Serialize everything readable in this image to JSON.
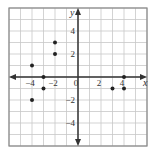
{
  "chart_data": {
    "type": "scatter",
    "title": "",
    "xlabel": "x",
    "ylabel": "y",
    "xlim": [
      -6,
      6
    ],
    "ylim": [
      -6,
      6
    ],
    "grid": true,
    "x_tick_labels": [
      {
        "value": -4,
        "text": "−4"
      },
      {
        "value": -2,
        "text": "−2"
      },
      {
        "value": 0,
        "text": "0"
      },
      {
        "value": 2,
        "text": "2"
      },
      {
        "value": 4,
        "text": "4"
      }
    ],
    "y_tick_labels": [
      {
        "value": 4,
        "text": "4"
      },
      {
        "value": 2,
        "text": "2"
      },
      {
        "value": -2,
        "text": "−2"
      },
      {
        "value": -4,
        "text": "−4"
      }
    ],
    "points": [
      {
        "x": -4,
        "y": 1
      },
      {
        "x": -4,
        "y": -2
      },
      {
        "x": -3,
        "y": 0
      },
      {
        "x": -3,
        "y": -1
      },
      {
        "x": -2,
        "y": 3
      },
      {
        "x": -2,
        "y": 2
      },
      {
        "x": 3,
        "y": -1
      },
      {
        "x": 4,
        "y": 0
      },
      {
        "x": 4,
        "y": -1
      }
    ],
    "colors": {
      "grid": "#c8c8c8",
      "axis": "#333333",
      "point": "#222222",
      "frame": "#888888"
    }
  }
}
